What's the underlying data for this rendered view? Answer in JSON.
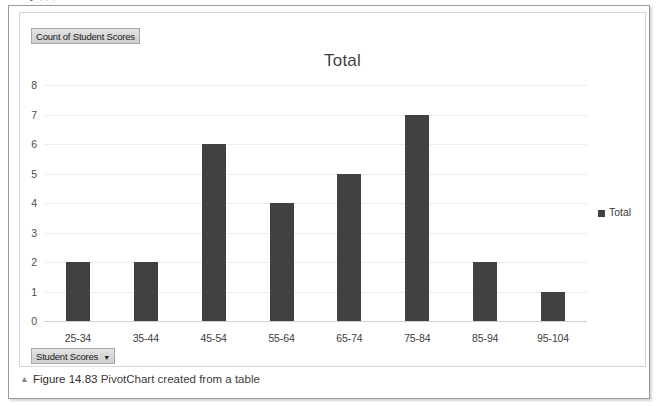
{
  "page": {
    "cutoff_text_above": "y                              ,           ,        ,"
  },
  "chart_panel": {
    "value_field_button": "Count of Student Scores",
    "axis_field_button": "Student Scores",
    "axis_field_caret": "▼",
    "title": "Total"
  },
  "legend": {
    "position": "right",
    "entries": [
      {
        "label": "Total",
        "color": "#414141"
      }
    ]
  },
  "caption": {
    "marker": "▲",
    "figure_number": "Figure 14.83",
    "text": "PivotChart created from a table",
    "full": "▲ Figure 14.83 PivotChart created from a table"
  },
  "chart_data": {
    "type": "bar",
    "title": "Total",
    "xlabel": "",
    "ylabel": "",
    "categories": [
      "25-34",
      "35-44",
      "45-54",
      "55-64",
      "65-74",
      "75-84",
      "85-94",
      "95-104"
    ],
    "values": [
      2,
      2,
      6,
      4,
      5,
      7,
      2,
      1
    ],
    "series": [
      {
        "name": "Total",
        "values": [
          2,
          2,
          6,
          4,
          5,
          7,
          2,
          1
        ],
        "color": "#414141"
      }
    ],
    "ylim": [
      0,
      8
    ],
    "yticks": [
      0,
      1,
      2,
      3,
      4,
      5,
      6,
      7,
      8
    ],
    "ytick_labels": [
      "0",
      "1",
      "2",
      "3",
      "4",
      "5",
      "6",
      "7",
      "8"
    ],
    "grid": true,
    "grid_color": "#ededed",
    "legend": [
      "Total"
    ],
    "legend_position": "right",
    "bar_color": "#414141"
  }
}
